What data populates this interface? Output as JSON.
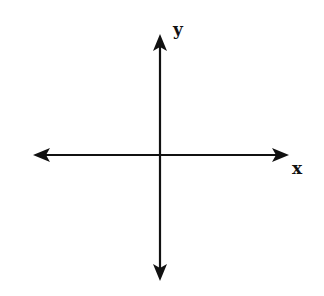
{
  "diagram": {
    "type": "coordinate-axes",
    "x_axis": {
      "label": "x",
      "direction": "bidirectional"
    },
    "y_axis": {
      "label": "y",
      "direction": "bidirectional"
    },
    "colors": {
      "line": "#111111",
      "background": "#ffffff"
    }
  }
}
